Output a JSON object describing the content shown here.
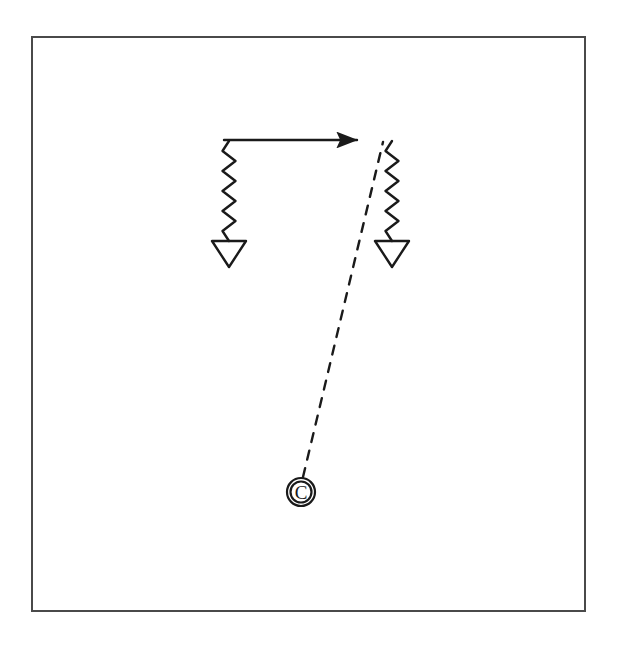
{
  "figure": {
    "background_color": "#ffffff",
    "ink_color": "#1a1a1a",
    "frame": {
      "name": "outer-border",
      "x": 32,
      "y": 37,
      "width": 553,
      "height": 574,
      "stroke_color": "#4a4a4a",
      "stroke_width": 2,
      "fill": "#ffffff"
    }
  },
  "labels": {
    "vertex_c": "C"
  },
  "elements": {
    "arrow": {
      "name": "horizontal-arrow",
      "description": "solid horizontal arrow pointing right",
      "x1": 224,
      "y1": 140,
      "x2": 363,
      "y2": 140,
      "stroke_width": 2.4,
      "arrowhead": "filled-triangle",
      "direction": "right"
    },
    "left_wavy": {
      "name": "left-wavy-line",
      "description": "vertical zigzag / photon line descending from arrow tail",
      "x_center": 229,
      "y_start": 141,
      "y_end": 241,
      "amplitude": 6.5,
      "half_periods": 10,
      "stroke_width": 2.4
    },
    "right_wavy": {
      "name": "right-wavy-line",
      "description": "vertical zigzag / photon line descending from arrow head region",
      "x_center": 392,
      "y_start": 141,
      "y_end": 241,
      "amplitude": 6.5,
      "half_periods": 10,
      "stroke_width": 2.4
    },
    "left_triangle": {
      "name": "left-down-triangle",
      "description": "hollow downward pointing triangle terminator",
      "cx": 229,
      "top_y": 241,
      "half_width": 17,
      "height": 26,
      "stroke_width": 2.4,
      "fill": "none"
    },
    "right_triangle": {
      "name": "right-down-triangle",
      "description": "hollow downward pointing triangle terminator",
      "cx": 392,
      "top_y": 241,
      "half_width": 17,
      "height": 26,
      "stroke_width": 2.4,
      "fill": "none"
    },
    "dashed_line": {
      "name": "dashed-propagator-line",
      "description": "long dashed line from circled C vertex up to top of right wavy line",
      "x1": 303,
      "y1": 477,
      "x2": 383,
      "y2": 142,
      "stroke_width": 2.4,
      "dash_length": 9,
      "gap_length": 9
    },
    "vertex_circle": {
      "name": "circled-c-vertex",
      "description": "letter C enclosed in a circle marking the vertex",
      "cx": 301,
      "cy": 492,
      "outer_radius": 14,
      "inner_radius": 10.5,
      "stroke_width": 2.2,
      "font_size": 19,
      "fill": "none"
    }
  }
}
